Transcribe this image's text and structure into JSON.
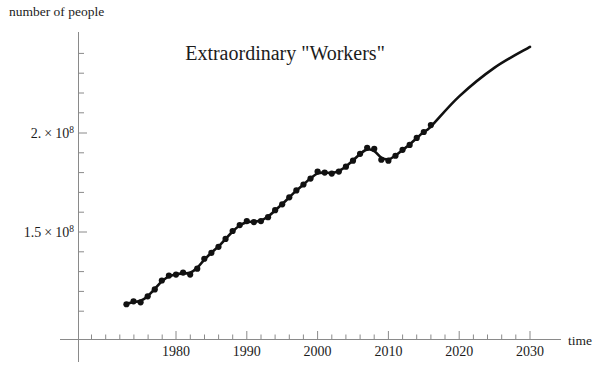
{
  "chart_data": {
    "type": "scatter",
    "title": "Extraordinary  \"Workers\"",
    "xlabel": "time",
    "ylabel": "number of people",
    "xlim": [
      1972,
      2031
    ],
    "ylim": [
      108000000,
      252000000
    ],
    "grid": false,
    "legend": null,
    "x_ticks_major": [
      "1980",
      "1990",
      "2000",
      "2010",
      "2020",
      "2030"
    ],
    "x_tick_values": [
      1980,
      1990,
      2000,
      2010,
      2020,
      2030
    ],
    "x_minor_tick_interval": 2,
    "y_ticks_major": [
      "1.5 × 10⁸",
      "2. × 10⁸"
    ],
    "y_tick_values": [
      150000000,
      200000000
    ],
    "y_tick_mantissas": [
      "1.5",
      "2."
    ],
    "y_tick_exponent": "8",
    "y_tick_base": "10",
    "y_minor_tick_interval": 10000000,
    "series": [
      {
        "name": "data points",
        "marker": "filled-circle",
        "color": "#111111",
        "x": [
          1973,
          1974,
          1975,
          1976,
          1977,
          1978,
          1979,
          1980,
          1981,
          1982,
          1983,
          1984,
          1985,
          1986,
          1987,
          1988,
          1989,
          1990,
          1991,
          1992,
          1993,
          1994,
          1995,
          1996,
          1997,
          1998,
          1999,
          2000,
          2001,
          2002,
          2003,
          2004,
          2005,
          2006,
          2007,
          2008,
          2009,
          2010,
          2011,
          2012,
          2013,
          2014,
          2015,
          2016
        ],
        "y": [
          113500000,
          115000000,
          114500000,
          117500000,
          121000000,
          125500000,
          128000000,
          128500000,
          129500000,
          128500000,
          131500000,
          136500000,
          139500000,
          142500000,
          146500000,
          150500000,
          153500000,
          155500000,
          155000000,
          155500000,
          157500000,
          161000000,
          164000000,
          167500000,
          171000000,
          174000000,
          177000000,
          180500000,
          180000000,
          179500000,
          180500000,
          183000000,
          186000000,
          189500000,
          192500000,
          192000000,
          186500000,
          186000000,
          188500000,
          191500000,
          194000000,
          197500000,
          200500000,
          204000000
        ]
      },
      {
        "name": "fitted curve",
        "marker": "none",
        "color": "#111111",
        "x": [
          1972,
          1975,
          1980,
          1983,
          1985,
          1990,
          1992,
          1995,
          2000,
          2002,
          2005,
          2007,
          2009,
          2012,
          2016,
          2020,
          2025,
          2030
        ],
        "y": [
          111500000,
          115000000,
          128500000,
          128000000,
          138500000,
          155000000,
          155000000,
          163500000,
          180000000,
          178500000,
          185500000,
          192500000,
          185500000,
          191500000,
          204500000,
          218500000,
          233000000,
          243500000
        ]
      }
    ],
    "annotations": []
  },
  "axis_labels": {
    "y_axis_caption": "number of people",
    "x_axis_caption": "time"
  },
  "title_parts": {
    "word_main": "Extraordinary",
    "word_quoted": "\"Workers\""
  }
}
